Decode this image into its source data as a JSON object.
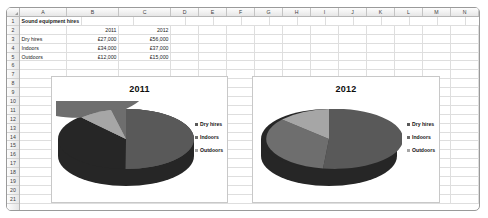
{
  "spreadsheet": {
    "columns": [
      "A",
      "B",
      "C",
      "D",
      "E",
      "F",
      "G",
      "H",
      "I",
      "J",
      "K",
      "L",
      "M",
      "N",
      "O"
    ],
    "rows": [
      "1",
      "2",
      "3",
      "4",
      "5",
      "6",
      "7",
      "8",
      "9",
      "10",
      "11",
      "12",
      "13",
      "14",
      "15",
      "16",
      "17",
      "18",
      "19",
      "20",
      "21"
    ],
    "cells": {
      "a1": "Sound equipment hires",
      "b2": "2011",
      "c2": "2012",
      "a3": "Dry hires",
      "b3": "£27,000",
      "c3": "£56,000",
      "a4": "Indoors",
      "b4": "£34,000",
      "c4": "£37,000",
      "a5": "Outdoors",
      "b5": "£12,000",
      "c5": "£15,000"
    }
  },
  "colors": {
    "dry_hires": "#595959",
    "indoors": "#6e6e6e",
    "outdoors": "#a6a6a6",
    "pie_side_dark": "#262626",
    "grid_line": "#dedede",
    "header_text": "#3d3d3d"
  },
  "charts": [
    {
      "id": "chart-2011",
      "title": "2011",
      "legend": [
        {
          "label": "Dry hires",
          "color": "#595959"
        },
        {
          "label": "Indoors",
          "color": "#6e6e6e"
        },
        {
          "label": "Outdoors",
          "color": "#a6a6a6"
        }
      ]
    },
    {
      "id": "chart-2012",
      "title": "2012",
      "legend": [
        {
          "label": "Dry hires",
          "color": "#595959"
        },
        {
          "label": "Indoors",
          "color": "#6e6e6e"
        },
        {
          "label": "Outdoors",
          "color": "#a6a6a6"
        }
      ]
    }
  ],
  "chart_data": [
    {
      "type": "pie",
      "title": "2011",
      "categories": [
        "Dry hires",
        "Indoors",
        "Outdoors"
      ],
      "values": [
        27000,
        34000,
        12000
      ],
      "value_labels": [
        "£27,000",
        "£34,000",
        "£12,000"
      ],
      "percentages": [
        37,
        47,
        16
      ],
      "colors": [
        "#595959",
        "#6e6e6e",
        "#a6a6a6"
      ],
      "legend_position": "right",
      "three_d": true,
      "start_angle": 0
    },
    {
      "type": "pie",
      "title": "2012",
      "categories": [
        "Dry hires",
        "Indoors",
        "Outdoors"
      ],
      "values": [
        56000,
        37000,
        15000
      ],
      "value_labels": [
        "£56,000",
        "£37,000",
        "£15,000"
      ],
      "percentages": [
        52,
        34,
        14
      ],
      "colors": [
        "#595959",
        "#6e6e6e",
        "#a6a6a6"
      ],
      "legend_position": "right",
      "three_d": true,
      "start_angle": 0
    }
  ]
}
